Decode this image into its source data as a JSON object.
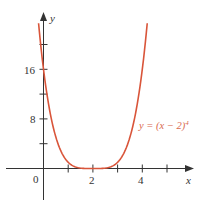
{
  "chart_data": {
    "type": "line",
    "title": "",
    "function": "y = (x - 2)^4",
    "xlabel": "x",
    "ylabel": "y",
    "xlim": [
      -1.5,
      6
    ],
    "ylim": [
      -6,
      24
    ],
    "x_ticks": [
      1,
      2,
      3,
      4,
      5
    ],
    "x_tick_labels": {
      "0": "0",
      "2": "2",
      "4": "4"
    },
    "y_ticks": [
      4,
      8,
      12,
      16,
      20
    ],
    "y_tick_labels": {
      "8": "8",
      "16": "16"
    },
    "grid": false,
    "series": [
      {
        "name": "y = (x - 2)^4",
        "color": "#d9553a",
        "x": [
          -0.2,
          0,
          0.5,
          1,
          1.5,
          2,
          2.5,
          3,
          3.5,
          4,
          4.2
        ],
        "y": [
          23.4,
          16,
          5.06,
          1,
          0.06,
          0,
          0.06,
          1,
          5.06,
          16,
          23.4
        ]
      }
    ],
    "annotations": [
      {
        "text": "y = (x − 2)",
        "superscript": "4",
        "x": 4.0,
        "y": 6.5
      }
    ]
  },
  "labels": {
    "origin": "0",
    "x_axis": "x",
    "y_axis": "y",
    "x2": "2",
    "x4": "4",
    "y8": "8",
    "y16": "16",
    "eq_main": "y = (x − 2)",
    "eq_exp": "4"
  },
  "colors": {
    "curve": "#d9553a",
    "axes": "#333333",
    "equation": "#d9694e"
  }
}
